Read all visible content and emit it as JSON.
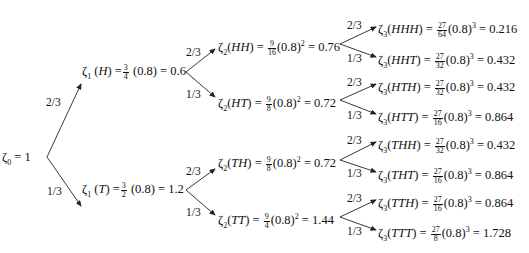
{
  "diagram": {
    "root": {
      "label": "ζ₀ = 1",
      "sym": "ζ",
      "sub": "0",
      "value": "1"
    },
    "level1": [
      {
        "id": "H",
        "sym": "ζ",
        "sub": "1",
        "path": "H",
        "frac_num": "3",
        "frac_den": "4",
        "base": "(0.8)",
        "exp": "",
        "value": "0.6",
        "prob_in": "2/3"
      },
      {
        "id": "T",
        "sym": "ζ",
        "sub": "1",
        "path": "T",
        "frac_num": "3",
        "frac_den": "2",
        "base": "(0.8)",
        "exp": "",
        "value": "1.2",
        "prob_in": "1/3"
      }
    ],
    "level2": [
      {
        "id": "HH",
        "sym": "ζ",
        "sub": "2",
        "path": "HH",
        "frac_num": "9",
        "frac_den": "16",
        "base": "(0.8)",
        "exp": "2",
        "value": "0.76",
        "prob_in": "2/3"
      },
      {
        "id": "HT",
        "sym": "ζ",
        "sub": "2",
        "path": "HT",
        "frac_num": "9",
        "frac_den": "8",
        "base": "(0.8)",
        "exp": "2",
        "value": "0.72",
        "prob_in": "1/3"
      },
      {
        "id": "TH",
        "sym": "ζ",
        "sub": "2",
        "path": "TH",
        "frac_num": "9",
        "frac_den": "8",
        "base": "(0.8)",
        "exp": "2",
        "value": "0.72",
        "prob_in": "2/3"
      },
      {
        "id": "TT",
        "sym": "ζ",
        "sub": "2",
        "path": "TT",
        "frac_num": "9",
        "frac_den": "4",
        "base": "(0.8)",
        "exp": "2",
        "value": "1.44",
        "prob_in": "1/3"
      }
    ],
    "level3": [
      {
        "id": "HHH",
        "sym": "ζ",
        "sub": "3",
        "path": "HHH",
        "frac_num": "27",
        "frac_den": "64",
        "base": "(0.8)",
        "exp": "3",
        "value": "0.216",
        "prob_in": "2/3"
      },
      {
        "id": "HHT",
        "sym": "ζ",
        "sub": "3",
        "path": "HHT",
        "frac_num": "27",
        "frac_den": "32",
        "base": "(0.8)",
        "exp": "3",
        "value": "0.432",
        "prob_in": "1/3"
      },
      {
        "id": "HTH",
        "sym": "ζ",
        "sub": "3",
        "path": "HTH",
        "frac_num": "27",
        "frac_den": "32",
        "base": "(0.8)",
        "exp": "3",
        "value": "0.432",
        "prob_in": "2/3"
      },
      {
        "id": "HTT",
        "sym": "ζ",
        "sub": "3",
        "path": "HTT",
        "frac_num": "27",
        "frac_den": "16",
        "base": "(0.8)",
        "exp": "3",
        "value": "0.864",
        "prob_in": "1/3"
      },
      {
        "id": "THH",
        "sym": "ζ",
        "sub": "3",
        "path": "THH",
        "frac_num": "27",
        "frac_den": "32",
        "base": "(0.8)",
        "exp": "3",
        "value": "0.432",
        "prob_in": "2/3"
      },
      {
        "id": "THT",
        "sym": "ζ",
        "sub": "3",
        "path": "THT",
        "frac_num": "27",
        "frac_den": "16",
        "base": "(0.8)",
        "exp": "3",
        "value": "0.864",
        "prob_in": "1/3"
      },
      {
        "id": "TTH",
        "sym": "ζ",
        "sub": "3",
        "path": "TTH",
        "frac_num": "27",
        "frac_den": "16",
        "base": "(0.8)",
        "exp": "3",
        "value": "0.864",
        "prob_in": "2/3"
      },
      {
        "id": "TTT",
        "sym": "ζ",
        "sub": "3",
        "path": "TTT",
        "frac_num": "27",
        "frac_den": "8",
        "base": "(0.8)",
        "exp": "3",
        "value": "1.728",
        "prob_in": "1/3"
      }
    ],
    "edge_color": "#222222"
  }
}
